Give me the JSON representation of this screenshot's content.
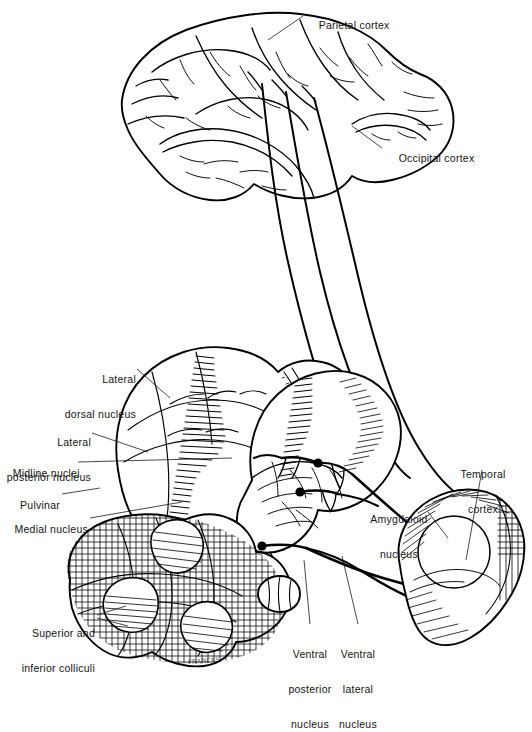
{
  "figure": {
    "artist_signature": "FRANCES",
    "caption": ""
  },
  "labels": {
    "parietal_cortex": "Parietal cortex",
    "occipital_cortex": "Occipital cortex",
    "lateral_dorsal_nucleus_l1": "Lateral",
    "lateral_dorsal_nucleus_l2": "dorsal nucleus",
    "lateral_posterior_nucleus_l1": "Lateral",
    "lateral_posterior_nucleus_l2": "posterior nucleus",
    "midline_nuclei": "Midline nuclei",
    "pulvinar": "Pulvinar",
    "medial_nucleus": "Medial nucleus",
    "superior_inferior_colliculi_l1": "Superior and",
    "superior_inferior_colliculi_l2": "inferior colliculi",
    "ventral_posterior_nucleus_l1": "Ventral",
    "ventral_posterior_nucleus_l2": "posterior",
    "ventral_posterior_nucleus_l3": "nucleus",
    "ventral_lateral_nucleus_l1": "Ventral",
    "ventral_lateral_nucleus_l2": "lateral",
    "ventral_lateral_nucleus_l3": "nucleus",
    "amygdaloid_nucleus_l1": "Amygdaloid",
    "amygdaloid_nucleus_l2": "nucleus",
    "temporal_cortex_l1": "Temporal",
    "temporal_cortex_l2": "cortex"
  },
  "colors": {
    "ink": "#000000",
    "paper": "#ffffff",
    "leader": "#1a1a1a",
    "label_text": "#141414"
  },
  "structures": [
    {
      "name": "cerebral-hemisphere",
      "region": "cortex"
    },
    {
      "name": "thalamus-left",
      "region": "diencephalon"
    },
    {
      "name": "thalamus-right",
      "region": "diencephalon"
    },
    {
      "name": "colliculi-midbrain",
      "region": "midbrain"
    },
    {
      "name": "temporal-lobe",
      "region": "cortex"
    },
    {
      "name": "amygdaloid-nucleus",
      "region": "limbic"
    },
    {
      "name": "corticothalamic-tracts",
      "region": "white-matter"
    }
  ]
}
